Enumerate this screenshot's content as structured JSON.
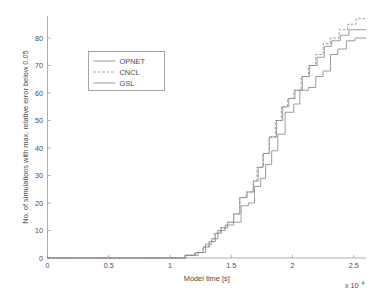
{
  "chart_data": {
    "type": "line",
    "title": "",
    "subtitle": "",
    "xlabel": "Model time [s]",
    "ylabel": "No. of simulations with max. relative error below 0.05",
    "x_exponent_label": "x 10",
    "x_exponent_sup": "4",
    "xlim": [
      0,
      26000
    ],
    "ylim": [
      0,
      88
    ],
    "x_ticks": [
      0,
      5000,
      10000,
      15000,
      20000,
      25000
    ],
    "x_tick_labels": [
      "0",
      "0.5",
      "1",
      "1.5",
      "2",
      "2.5"
    ],
    "y_ticks": [
      0,
      10,
      20,
      30,
      40,
      50,
      60,
      70,
      80
    ],
    "y_tick_labels": [
      "0",
      "10",
      "20",
      "30",
      "40",
      "50",
      "60",
      "70",
      "80"
    ],
    "grid": false,
    "legend_position": "upper left",
    "line_color": "#8a8a8a",
    "series": [
      {
        "name": "OPNET",
        "style": "solid",
        "points": [
          [
            0,
            0
          ],
          [
            11200,
            0
          ],
          [
            11200,
            1
          ],
          [
            12300,
            1
          ],
          [
            12300,
            2
          ],
          [
            12900,
            2
          ],
          [
            12900,
            5
          ],
          [
            13400,
            5
          ],
          [
            13400,
            7
          ],
          [
            13900,
            7
          ],
          [
            13900,
            10
          ],
          [
            14500,
            10
          ],
          [
            14500,
            12
          ],
          [
            15200,
            12
          ],
          [
            15200,
            13
          ],
          [
            15800,
            13
          ],
          [
            15800,
            19
          ],
          [
            16400,
            19
          ],
          [
            16400,
            20
          ],
          [
            16900,
            20
          ],
          [
            16900,
            26
          ],
          [
            17400,
            26
          ],
          [
            17400,
            29
          ],
          [
            17800,
            29
          ],
          [
            17800,
            34
          ],
          [
            18300,
            34
          ],
          [
            18300,
            39
          ],
          [
            18800,
            39
          ],
          [
            18800,
            45
          ],
          [
            19400,
            45
          ],
          [
            19400,
            53
          ],
          [
            20100,
            53
          ],
          [
            20100,
            56
          ],
          [
            20600,
            56
          ],
          [
            20600,
            61
          ],
          [
            21300,
            61
          ],
          [
            21300,
            62
          ],
          [
            21900,
            62
          ],
          [
            21900,
            66
          ],
          [
            22500,
            66
          ],
          [
            22500,
            68
          ],
          [
            23100,
            68
          ],
          [
            23100,
            74
          ],
          [
            23700,
            74
          ],
          [
            23700,
            76
          ],
          [
            24400,
            76
          ],
          [
            24400,
            79
          ],
          [
            25100,
            79
          ],
          [
            25100,
            80
          ],
          [
            26000,
            80
          ]
        ]
      },
      {
        "name": "CNCL",
        "style": "dashed",
        "points": [
          [
            0,
            0
          ],
          [
            11300,
            0
          ],
          [
            11300,
            1
          ],
          [
            12000,
            1
          ],
          [
            12000,
            2
          ],
          [
            12700,
            2
          ],
          [
            12700,
            4
          ],
          [
            13200,
            4
          ],
          [
            13200,
            6
          ],
          [
            13600,
            6
          ],
          [
            13600,
            9
          ],
          [
            14100,
            9
          ],
          [
            14100,
            11
          ],
          [
            14700,
            11
          ],
          [
            14700,
            13
          ],
          [
            15200,
            13
          ],
          [
            15200,
            16
          ],
          [
            15700,
            16
          ],
          [
            15700,
            22
          ],
          [
            16200,
            22
          ],
          [
            16200,
            24
          ],
          [
            16800,
            24
          ],
          [
            16800,
            28
          ],
          [
            17100,
            28
          ],
          [
            17100,
            33
          ],
          [
            17600,
            33
          ],
          [
            17600,
            38
          ],
          [
            18100,
            38
          ],
          [
            18100,
            44
          ],
          [
            18600,
            44
          ],
          [
            18600,
            50
          ],
          [
            19100,
            50
          ],
          [
            19100,
            55
          ],
          [
            19600,
            55
          ],
          [
            19600,
            58
          ],
          [
            20100,
            58
          ],
          [
            20100,
            61
          ],
          [
            20700,
            61
          ],
          [
            20700,
            66
          ],
          [
            21300,
            66
          ],
          [
            21300,
            70
          ],
          [
            21900,
            70
          ],
          [
            21900,
            74
          ],
          [
            22500,
            74
          ],
          [
            22500,
            78
          ],
          [
            23100,
            78
          ],
          [
            23100,
            80
          ],
          [
            23800,
            80
          ],
          [
            23800,
            83
          ],
          [
            24500,
            83
          ],
          [
            24500,
            85
          ],
          [
            25200,
            85
          ],
          [
            25200,
            87
          ],
          [
            26000,
            87
          ]
        ]
      },
      {
        "name": "GSL",
        "style": "solid",
        "points": [
          [
            0,
            0
          ],
          [
            11300,
            0
          ],
          [
            11300,
            1
          ],
          [
            12100,
            1
          ],
          [
            12100,
            2
          ],
          [
            12700,
            2
          ],
          [
            12700,
            4
          ],
          [
            13200,
            4
          ],
          [
            13200,
            6
          ],
          [
            13700,
            6
          ],
          [
            13700,
            9
          ],
          [
            14200,
            9
          ],
          [
            14200,
            11
          ],
          [
            14700,
            11
          ],
          [
            14700,
            13
          ],
          [
            15200,
            13
          ],
          [
            15200,
            16
          ],
          [
            15700,
            16
          ],
          [
            15700,
            22
          ],
          [
            16300,
            22
          ],
          [
            16300,
            24
          ],
          [
            16800,
            24
          ],
          [
            16800,
            28
          ],
          [
            17200,
            28
          ],
          [
            17200,
            33
          ],
          [
            17600,
            33
          ],
          [
            17600,
            38
          ],
          [
            18100,
            38
          ],
          [
            18100,
            44
          ],
          [
            18700,
            44
          ],
          [
            18700,
            50
          ],
          [
            19200,
            50
          ],
          [
            19200,
            55
          ],
          [
            19700,
            55
          ],
          [
            19700,
            58
          ],
          [
            20200,
            58
          ],
          [
            20200,
            61
          ],
          [
            20800,
            61
          ],
          [
            20800,
            66
          ],
          [
            21400,
            66
          ],
          [
            21400,
            70
          ],
          [
            22000,
            70
          ],
          [
            22000,
            73
          ],
          [
            22600,
            73
          ],
          [
            22600,
            77
          ],
          [
            23200,
            77
          ],
          [
            23200,
            79
          ],
          [
            23900,
            79
          ],
          [
            23900,
            81
          ],
          [
            24600,
            81
          ],
          [
            24600,
            83
          ],
          [
            26000,
            83
          ]
        ]
      }
    ]
  },
  "legend": {
    "items": [
      {
        "label": "OPNET",
        "style": "solid"
      },
      {
        "label": "CNCL",
        "style": "dashed"
      },
      {
        "label": "GSL",
        "style": "solid"
      }
    ]
  }
}
